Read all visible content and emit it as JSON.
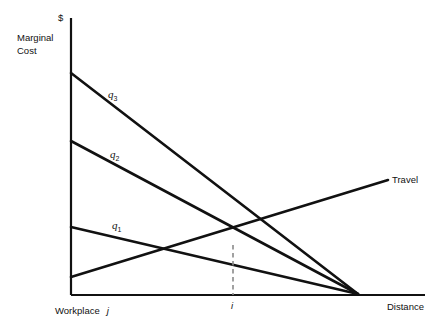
{
  "figure": {
    "background_color": "#ffffff",
    "line_color": "#111111",
    "dash_color": "#808080"
  },
  "axes": {
    "y_axis_symbol": "$",
    "y_axis_label_line1": "Marginal",
    "y_axis_label_line2": "Cost",
    "x_axis_label_right": "Distance",
    "x_origin_label": "Workplace",
    "x_origin_symbol": "j",
    "x_tick_symbol": "i",
    "y_axis_x": 71,
    "y_axis_top": 18,
    "x_axis_y": 295,
    "x_axis_right": 425
  },
  "curves": [
    {
      "name": "q3",
      "label": "q",
      "subscript": "3",
      "label_x": 108,
      "label_y": 88,
      "start": [
        71,
        73
      ],
      "end": [
        358,
        294
      ],
      "kind": "marginal-cost"
    },
    {
      "name": "q2",
      "label": "q",
      "subscript": "2",
      "label_x": 110,
      "label_y": 148,
      "start": [
        71,
        141
      ],
      "end": [
        358,
        294
      ],
      "kind": "marginal-cost"
    },
    {
      "name": "q1",
      "label": "q",
      "subscript": "1",
      "label_x": 112,
      "label_y": 219,
      "start": [
        71,
        227
      ],
      "end": [
        358,
        294
      ],
      "kind": "marginal-cost"
    },
    {
      "name": "travel",
      "label": "Travel",
      "subscript": "",
      "label_x": 392,
      "label_y": 174,
      "start": [
        71,
        277
      ],
      "end": [
        388,
        180
      ],
      "kind": "travel-cost"
    }
  ],
  "annotations": {
    "dashed_line": {
      "name": "equilibrium-dropline",
      "x": 233,
      "y_top": 245,
      "y_bottom": 295
    },
    "intersection_point": {
      "x": 233,
      "y": 245,
      "curves": [
        "q2",
        "travel"
      ]
    },
    "convergence_point": {
      "x": 358,
      "y": 294,
      "curves": [
        "q1",
        "q2",
        "q3"
      ]
    }
  },
  "chart_data": {
    "type": "line",
    "xlabel": "Distance",
    "ylabel": "Marginal Cost ($)",
    "xlim": [
      0,
      100
    ],
    "ylim": [
      0,
      100
    ],
    "grid": false,
    "legend": "inline-labels",
    "x_tick_labels": [
      "Workplace j",
      "i"
    ],
    "series": [
      {
        "name": "q3",
        "label": "q3",
        "x": [
          0,
          100
        ],
        "values": [
          80,
          0
        ]
      },
      {
        "name": "q2",
        "label": "q2",
        "x": [
          0,
          100
        ],
        "values": [
          55,
          0
        ]
      },
      {
        "name": "q1",
        "label": "q1",
        "x": [
          0,
          100
        ],
        "values": [
          24,
          0
        ]
      },
      {
        "name": "Travel",
        "label": "Travel",
        "x": [
          0,
          110
        ],
        "values": [
          6,
          41
        ]
      }
    ],
    "annotations": [
      {
        "text": "i",
        "type": "dropline",
        "x": 58,
        "from_y": 18,
        "to_y": 0
      }
    ]
  }
}
